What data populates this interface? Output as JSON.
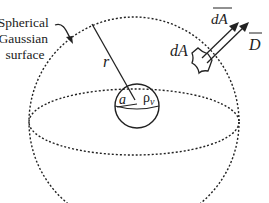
{
  "diagram": {
    "callout_label": [
      "Spherical",
      "Gaussian",
      "surface"
    ],
    "radius_label": "r",
    "inner_radius_label": "a",
    "charge_density_label": "ρ",
    "charge_density_subscript": "v",
    "area_element_label": "dA",
    "vector_area_label": "dA",
    "flux_density_label": "D",
    "colors": {
      "line": "#222222",
      "background": "#ffffff"
    }
  }
}
